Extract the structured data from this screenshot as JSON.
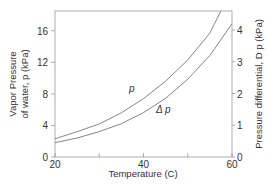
{
  "chart_data": {
    "type": "line",
    "title": "",
    "xlabel": "Temperature  (C)",
    "ylabel": [
      "Vapor Pressure",
      "of water, p  (kPa)"
    ],
    "y2label": "Pressure differential, D p  (kPa)",
    "xlim": [
      20,
      60
    ],
    "ylim": [
      0,
      18.5
    ],
    "y2lim": [
      0,
      4.6
    ],
    "x_ticks": [
      20,
      30,
      40,
      50,
      60
    ],
    "x_tick_labels": [
      "20",
      "",
      "40",
      "",
      "60"
    ],
    "y_ticks": [
      0,
      4,
      8,
      12,
      16
    ],
    "y_tick_labels": [
      "0",
      "4",
      "8",
      "12",
      "16"
    ],
    "y2_ticks": [
      0,
      1,
      2,
      3,
      4
    ],
    "y2_tick_labels": [
      "0",
      "1",
      "2",
      "3",
      "4"
    ],
    "grid": false,
    "legend": "inline labels",
    "series": [
      {
        "name": "p",
        "axis": "left",
        "x": [
          20,
          25,
          30,
          35,
          40,
          45,
          50,
          55,
          57.5
        ],
        "values": [
          2.3,
          3.2,
          4.2,
          5.6,
          7.4,
          9.6,
          12.3,
          15.7,
          18.5
        ]
      },
      {
        "name": "Δ p",
        "axis": "right",
        "x": [
          20,
          25,
          30,
          35,
          40,
          45,
          50,
          55,
          60
        ],
        "values": [
          0.45,
          0.6,
          0.8,
          1.05,
          1.4,
          1.85,
          2.45,
          3.2,
          4.2
        ]
      }
    ]
  },
  "labels": {
    "p": "p",
    "dp": "Δ p"
  }
}
